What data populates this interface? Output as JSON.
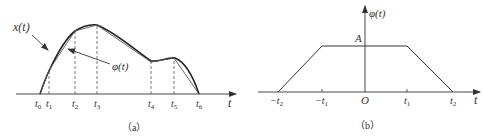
{
  "panel_a": {
    "caption": "（a）",
    "curve_label": "x(t)",
    "approx_label": "φ(t)",
    "axis_label": "t",
    "ticks": [
      {
        "name": "t",
        "sub": "0",
        "x": 40
      },
      {
        "name": "t",
        "sub": "1",
        "x": 49
      },
      {
        "name": "t",
        "sub": "2",
        "x": 75
      },
      {
        "name": "t",
        "sub": "3",
        "x": 97
      },
      {
        "name": "t",
        "sub": "4",
        "x": 151
      },
      {
        "name": "t",
        "sub": "5",
        "x": 174
      },
      {
        "name": "t",
        "sub": "6",
        "x": 199
      }
    ],
    "approx_points": [
      [
        40,
        94
      ],
      [
        49,
        70
      ],
      [
        75,
        31
      ],
      [
        97,
        25
      ],
      [
        151,
        62
      ],
      [
        174,
        58
      ],
      [
        199,
        94
      ]
    ]
  },
  "panel_b": {
    "caption": "（b）",
    "y_axis_label": "φ(t)",
    "x_axis_label": "t",
    "level_label": "A",
    "origin_label": "O",
    "ticks": [
      {
        "label": "−t",
        "sub": "2"
      },
      {
        "label": "−t",
        "sub": "1"
      },
      {
        "label": "t",
        "sub": "1"
      },
      {
        "label": "t",
        "sub": "2"
      }
    ]
  },
  "colors": {
    "stroke": "#333333",
    "dashed": "#555555"
  }
}
